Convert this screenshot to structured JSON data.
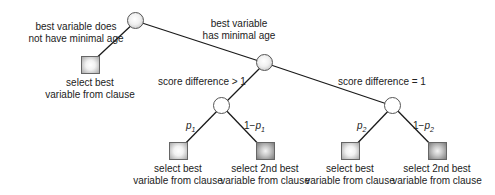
{
  "diagram": {
    "type": "decision-tree",
    "nodes": [
      {
        "id": "root",
        "shape": "circle",
        "style": "shaded"
      },
      {
        "id": "min-age",
        "shape": "circle",
        "style": "shaded"
      },
      {
        "id": "diff-gt-1",
        "shape": "circle",
        "style": "plain"
      },
      {
        "id": "diff-eq-1",
        "shape": "circle",
        "style": "plain"
      },
      {
        "id": "leaf-0",
        "shape": "square",
        "style": "light"
      },
      {
        "id": "leaf-1",
        "shape": "square",
        "style": "light"
      },
      {
        "id": "leaf-2",
        "shape": "square",
        "style": "dark"
      },
      {
        "id": "leaf-3",
        "shape": "square",
        "style": "light"
      },
      {
        "id": "leaf-4",
        "shape": "square",
        "style": "dark"
      }
    ],
    "edge_labels": {
      "root_left_line1": "best variable does",
      "root_left_line2": "not have minimal age",
      "root_right_line1": "best variable",
      "root_right_line2": "has minimal age",
      "min_age_left": "score difference > 1",
      "min_age_right": "score difference = 1",
      "p1": {
        "base": "p",
        "sub": "1"
      },
      "one_minus_p1": {
        "prefix": "1−",
        "base": "p",
        "sub": "1"
      },
      "p2": {
        "base": "p",
        "sub": "2"
      },
      "one_minus_p2": {
        "prefix": "1−",
        "base": "p",
        "sub": "2"
      }
    },
    "leaf_labels": [
      {
        "line1": "select best",
        "line2": "variable from clause"
      },
      {
        "line1": "select best",
        "line2": "variable from clause"
      },
      {
        "line1": "select 2nd best",
        "line2": "variable from clause"
      },
      {
        "line1": "select best",
        "line2": "variable from clause"
      },
      {
        "line1": "select 2nd best",
        "line2": "variable from clause"
      }
    ],
    "colors": {
      "edge": "#1a1a1a",
      "node_border": "#555555",
      "text": "#222222"
    }
  }
}
